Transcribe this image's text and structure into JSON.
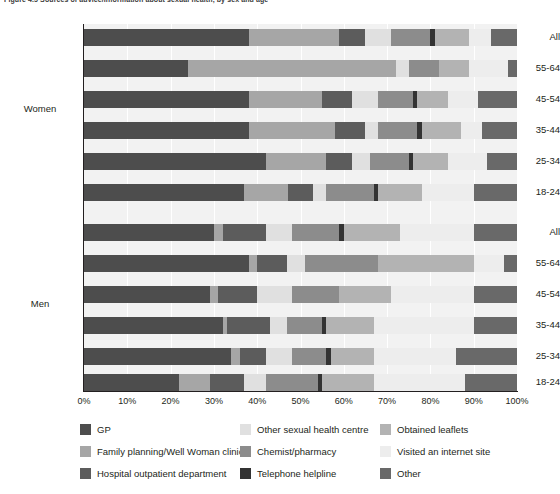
{
  "chart_data": {
    "type": "bar",
    "orientation": "horizontal",
    "stacked": true,
    "stacked_mode": "percent",
    "title": "Figure 4.5  Sources of advice/information about sexual health, by sex and age",
    "xlabel": "",
    "ylabel": "",
    "xlim": [
      0,
      100
    ],
    "xticks": [
      "0%",
      "10%",
      "20%",
      "30%",
      "40%",
      "50%",
      "60%",
      "70%",
      "80%",
      "90%",
      "100%"
    ],
    "grid": true,
    "legend_position": "bottom",
    "groups": [
      "Women",
      "Men"
    ],
    "categories": [
      "All",
      "55-64",
      "45-54",
      "35-44",
      "25-34",
      "18-24",
      "All",
      "55-64",
      "45-54",
      "35-44",
      "25-34",
      "18-24"
    ],
    "series": [
      {
        "name": "GP",
        "color": "#4d4d4d",
        "values": [
          38,
          24,
          38,
          38,
          42,
          37,
          30,
          38,
          29,
          32,
          34,
          22
        ]
      },
      {
        "name": "Family planning/Well Woman clinic",
        "color": "#a6a6a6",
        "values": [
          21,
          48,
          17,
          20,
          14,
          10,
          2,
          2,
          2,
          1,
          2,
          7
        ]
      },
      {
        "name": "Hospital outpatient department",
        "color": "#5c5c5c",
        "values": [
          6,
          0,
          7,
          7,
          6,
          6,
          10,
          7,
          9,
          10,
          6,
          8
        ]
      },
      {
        "name": "Other sexual health centre",
        "color": "#e0e0e0",
        "values": [
          6,
          3,
          6,
          3,
          4,
          3,
          6,
          4,
          8,
          4,
          6,
          5
        ]
      },
      {
        "name": "Chemist/pharmacy",
        "color": "#8c8c8c",
        "values": [
          9,
          7,
          8,
          9,
          9,
          11,
          11,
          17,
          11,
          8,
          8,
          12
        ]
      },
      {
        "name": "Telephone helpline",
        "color": "#333333",
        "values": [
          1,
          0,
          1,
          1,
          1,
          1,
          1,
          0,
          0,
          1,
          1,
          1
        ]
      },
      {
        "name": "Obtained leaflets",
        "color": "#b3b3b3",
        "values": [
          8,
          7,
          7,
          9,
          8,
          10,
          13,
          22,
          12,
          11,
          10,
          12
        ]
      },
      {
        "name": "Visited an internet site",
        "color": "#ededed",
        "values": [
          5,
          9,
          7,
          5,
          9,
          12,
          17,
          7,
          19,
          23,
          19,
          21
        ]
      },
      {
        "name": "Other",
        "color": "#696969",
        "values": [
          6,
          2,
          9,
          8,
          7,
          10,
          10,
          3,
          10,
          10,
          14,
          12
        ]
      }
    ]
  },
  "axis": {
    "y_group_labels": [
      "Women",
      "Men"
    ],
    "y_category_labels": [
      "All",
      "55-64",
      "45-54",
      "35-44",
      "25-34",
      "18-24"
    ]
  },
  "legend": {
    "items": [
      {
        "label": "GP",
        "color": "#4d4d4d",
        "icon": "legend-swatch-gp"
      },
      {
        "label": "Other sexual health centre",
        "color": "#e0e0e0",
        "icon": "legend-swatch-other-sexual-health-centre"
      },
      {
        "label": "Obtained leaflets",
        "color": "#b3b3b3",
        "icon": "legend-swatch-obtained-leaflets"
      },
      {
        "label": "Family planning/Well Woman clinic",
        "color": "#a6a6a6",
        "icon": "legend-swatch-family-planning"
      },
      {
        "label": "Chemist/pharmacy",
        "color": "#8c8c8c",
        "icon": "legend-swatch-chemist-pharmacy"
      },
      {
        "label": "Visited an internet site",
        "color": "#ededed",
        "icon": "legend-swatch-internet-site"
      },
      {
        "label": "Hospital outpatient department",
        "color": "#5c5c5c",
        "icon": "legend-swatch-hospital-outpatient"
      },
      {
        "label": "Telephone helpline",
        "color": "#333333",
        "icon": "legend-swatch-telephone-helpline"
      },
      {
        "label": "Other",
        "color": "#696969",
        "icon": "legend-swatch-other"
      }
    ]
  },
  "colors": {
    "plot_background": "#f2f2f2",
    "gridline": "#ffffff",
    "axis": "#231f20",
    "text": "#231f20"
  }
}
